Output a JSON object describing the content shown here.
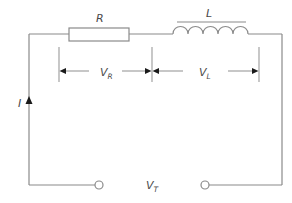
{
  "diagram": {
    "type": "series RL circuit",
    "colors": {
      "wire": "#8a8a8a",
      "arrow": "#1a1a1a",
      "text": "#4a4a4a",
      "background": "#ffffff"
    },
    "components": {
      "resistor": {
        "label": "R"
      },
      "inductor": {
        "label": "L"
      }
    },
    "voltages": {
      "resistor": {
        "symbol": "V",
        "subscript": "R"
      },
      "inductor": {
        "symbol": "V",
        "subscript": "L"
      },
      "total": {
        "symbol": "V",
        "subscript": "T"
      }
    },
    "current": {
      "label": "I"
    },
    "terminals": [
      "left-terminal",
      "right-terminal"
    ]
  }
}
